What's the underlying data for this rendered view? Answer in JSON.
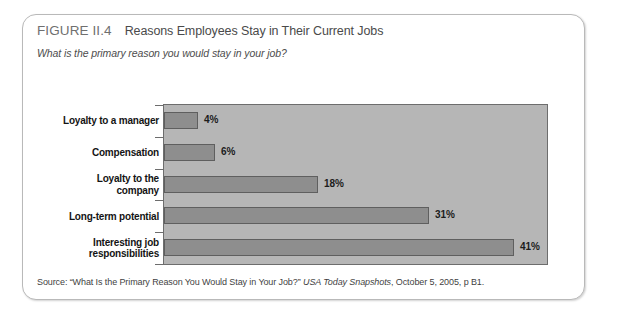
{
  "figure": {
    "number": "FIGURE II.4",
    "title": "Reasons Employees Stay in Their Current Jobs",
    "subtitle": "What is the primary reason you would stay in your job?"
  },
  "source": {
    "prefix": "Source: “What Is the Primary Reason You Would Stay in Your Job?” ",
    "publication": "USA Today Snapshots",
    "suffix": ", October 5, 2005, p B1."
  },
  "colors": {
    "bar_fill": "#8e8e8e",
    "bar_stroke": "#5f5f5f",
    "plot_background": "#b6b6b6",
    "card_background": "#ffffff",
    "card_border": "#b9b9b9"
  },
  "chart_data": {
    "type": "bar",
    "orientation": "horizontal",
    "title": "Reasons Employees Stay in Their Current Jobs",
    "subtitle": "What is the primary reason you would stay in your job?",
    "xlabel": "",
    "ylabel": "",
    "xlim": [
      0,
      45
    ],
    "grid": false,
    "legend": false,
    "value_suffix": "%",
    "categories": [
      "Loyalty to a manager",
      "Compensation",
      "Loyalty to the company",
      "Long-term potential",
      "Interesting job responsibilities"
    ],
    "values": [
      4,
      6,
      18,
      31,
      41
    ],
    "labels": [
      "4%",
      "6%",
      "18%",
      "31%",
      "41%"
    ],
    "category_lines": [
      [
        "Loyalty to a manager"
      ],
      [
        "Compensation"
      ],
      [
        "Loyalty to the",
        "company"
      ],
      [
        "Long-term potential"
      ],
      [
        "Interesting job",
        "responsibilities"
      ]
    ]
  }
}
